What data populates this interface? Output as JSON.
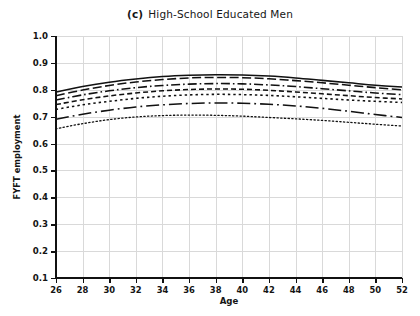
{
  "title": {
    "panel_tag": "(c)",
    "text": "High-School Educated Men"
  },
  "axes": {
    "x_title": "Age",
    "y_title": "FYFT employment",
    "x_ticks": [
      "26",
      "28",
      "30",
      "32",
      "34",
      "36",
      "38",
      "40",
      "42",
      "44",
      "46",
      "48",
      "50",
      "52"
    ],
    "y_ticks": [
      "1.0",
      "0.9",
      "0.8",
      "0.7",
      "0.6",
      "0.5",
      "0.4",
      "0.3",
      "0.2",
      "0.1"
    ]
  },
  "chart_data": {
    "type": "line",
    "xlabel": "Age",
    "ylabel": "FYFT employment",
    "xlim": [
      26,
      52
    ],
    "ylim": [
      0.1,
      1.0
    ],
    "xticks": [
      26,
      28,
      30,
      32,
      34,
      36,
      38,
      40,
      42,
      44,
      46,
      48,
      50,
      52
    ],
    "yticks": [
      0.1,
      0.2,
      0.3,
      0.4,
      0.5,
      0.6,
      0.7,
      0.8,
      0.9,
      1.0
    ],
    "grid": true,
    "legend": "none",
    "x": [
      26,
      28,
      30,
      32,
      34,
      36,
      38,
      40,
      42,
      44,
      46,
      48,
      50,
      52
    ],
    "series": [
      {
        "name": "series-1",
        "linestyle": "solid",
        "color": "#111111",
        "values": [
          0.792,
          0.812,
          0.828,
          0.84,
          0.849,
          0.854,
          0.856,
          0.855,
          0.851,
          0.844,
          0.835,
          0.826,
          0.817,
          0.81
        ]
      },
      {
        "name": "series-2",
        "linestyle": "long-dash",
        "color": "#111111",
        "values": [
          0.778,
          0.799,
          0.816,
          0.829,
          0.838,
          0.844,
          0.846,
          0.845,
          0.841,
          0.834,
          0.826,
          0.817,
          0.808,
          0.8
        ]
      },
      {
        "name": "series-3",
        "linestyle": "dash-dot",
        "color": "#111111",
        "values": [
          0.762,
          0.781,
          0.796,
          0.808,
          0.816,
          0.821,
          0.823,
          0.822,
          0.818,
          0.812,
          0.804,
          0.796,
          0.788,
          0.782
        ]
      },
      {
        "name": "series-4",
        "linestyle": "medium-dash",
        "color": "#111111",
        "values": [
          0.745,
          0.763,
          0.777,
          0.788,
          0.796,
          0.801,
          0.803,
          0.802,
          0.798,
          0.792,
          0.785,
          0.778,
          0.771,
          0.766
        ]
      },
      {
        "name": "series-5",
        "linestyle": "dotted",
        "color": "#111111",
        "values": [
          0.727,
          0.744,
          0.757,
          0.768,
          0.776,
          0.781,
          0.783,
          0.782,
          0.779,
          0.774,
          0.768,
          0.762,
          0.757,
          0.753
        ]
      },
      {
        "name": "series-6",
        "linestyle": "dash-dot-long",
        "color": "#111111",
        "values": [
          0.69,
          0.709,
          0.724,
          0.736,
          0.744,
          0.749,
          0.751,
          0.75,
          0.746,
          0.74,
          0.731,
          0.72,
          0.708,
          0.697
        ]
      },
      {
        "name": "series-7",
        "linestyle": "fine-dotted",
        "color": "#111111",
        "values": [
          0.655,
          0.674,
          0.689,
          0.699,
          0.704,
          0.706,
          0.705,
          0.702,
          0.697,
          0.692,
          0.686,
          0.679,
          0.672,
          0.665
        ]
      }
    ]
  }
}
